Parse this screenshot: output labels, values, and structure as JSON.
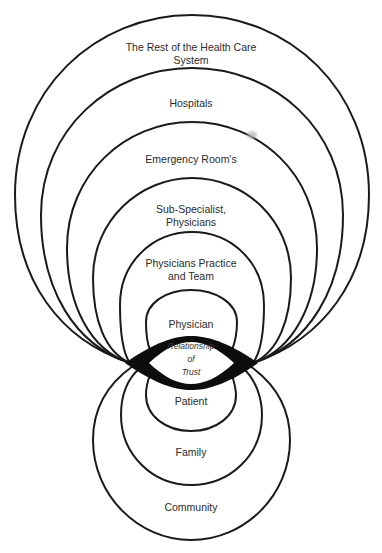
{
  "diagram": {
    "upper_rings": [
      {
        "id": "health-care-system",
        "label": "The Rest of the Health Care\nSystem"
      },
      {
        "id": "hospitals",
        "label": "Hospitals"
      },
      {
        "id": "emergency-rooms",
        "label": "Emergency Room's"
      },
      {
        "id": "sub-specialist",
        "label": "Sub-Specialist,\nPhysicians"
      },
      {
        "id": "physicians-practice",
        "label": "Physicians Practice\nand Team"
      },
      {
        "id": "physician",
        "label": "Physician"
      }
    ],
    "center": {
      "id": "relationship-of-trust",
      "label": "Relationship\nof\nTrust"
    },
    "lower_rings": [
      {
        "id": "patient",
        "label": "Patient"
      },
      {
        "id": "family",
        "label": "Family"
      },
      {
        "id": "community",
        "label": "Community"
      }
    ],
    "colors": {
      "stroke": "#1a1a1a",
      "lens": "#0d0d0d",
      "background": "#ffffff",
      "text": "#2b2b2b"
    }
  }
}
